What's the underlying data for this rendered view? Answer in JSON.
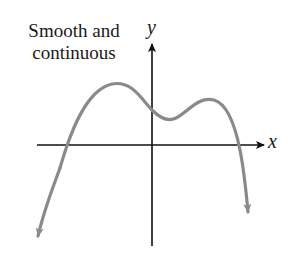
{
  "diagram": {
    "caption_line1": "Smooth and",
    "caption_line2": "continuous",
    "x_axis_label": "x",
    "y_axis_label": "y",
    "colors": {
      "axes": "#111111",
      "curve": "#8a8a8a",
      "text": "#1a1a1a"
    }
  }
}
